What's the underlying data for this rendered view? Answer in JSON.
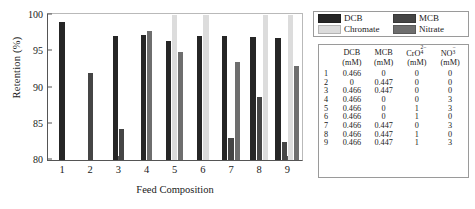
{
  "chart_data": {
    "type": "bar",
    "title": "",
    "xlabel": "Feed Composition",
    "ylabel": "Retention (%)",
    "categories": [
      "1",
      "2",
      "3",
      "4",
      "5",
      "6",
      "7",
      "8",
      "9"
    ],
    "ylim": [
      80,
      100
    ],
    "yticks": [
      80,
      85,
      90,
      95,
      100
    ],
    "grid": false,
    "legend_position": "outside-top-right",
    "series": [
      {
        "name": "DCB",
        "color": "#262626",
        "values": [
          99.0,
          null,
          97.0,
          97.2,
          96.4,
          97.0,
          97.0,
          96.9,
          96.8
        ]
      },
      {
        "name": "MCB",
        "color": "#454545",
        "values": [
          null,
          92.0,
          84.2,
          null,
          null,
          null,
          83.0,
          88.6,
          82.5
        ]
      },
      {
        "name": "Chromate",
        "color": "#dcdcdc",
        "values": [
          null,
          null,
          null,
          null,
          100.0,
          100.0,
          null,
          100.0,
          100.0
        ]
      },
      {
        "name": "Nitrate",
        "color": "#6e6e6e",
        "values": [
          null,
          null,
          null,
          97.7,
          94.8,
          null,
          93.5,
          null,
          93.0
        ]
      }
    ]
  },
  "legend": {
    "items": [
      {
        "label": "DCB",
        "color": "#262626"
      },
      {
        "label": "MCB",
        "color": "#454545"
      },
      {
        "label": "Chromate",
        "color": "#dcdcdc"
      },
      {
        "label": "Nitrate",
        "color": "#6e6e6e"
      }
    ]
  },
  "table": {
    "headers_line1": [
      "",
      "DCB",
      "MCB",
      "CrO4",
      "NO3"
    ],
    "headers_line2": [
      "",
      "(mM)",
      "(mM)",
      "(mM)",
      "(mM)"
    ],
    "col3_sup": "2−",
    "col3_sub": "4",
    "col4_sup": "−",
    "col4_sub": "3",
    "rows": [
      {
        "idx": "1",
        "dcb": "0.466",
        "mcb": "0",
        "cro4": "0",
        "no3": "0"
      },
      {
        "idx": "2",
        "dcb": "0",
        "mcb": "0.447",
        "cro4": "0",
        "no3": "0"
      },
      {
        "idx": "3",
        "dcb": "0.466",
        "mcb": "0.447",
        "cro4": "0",
        "no3": "0"
      },
      {
        "idx": "4",
        "dcb": "0.466",
        "mcb": "0",
        "cro4": "0",
        "no3": "3"
      },
      {
        "idx": "5",
        "dcb": "0.466",
        "mcb": "0",
        "cro4": "1",
        "no3": "3"
      },
      {
        "idx": "6",
        "dcb": "0.466",
        "mcb": "0",
        "cro4": "1",
        "no3": "0"
      },
      {
        "idx": "7",
        "dcb": "0.466",
        "mcb": "0.447",
        "cro4": "0",
        "no3": "3"
      },
      {
        "idx": "8",
        "dcb": "0.466",
        "mcb": "0.447",
        "cro4": "1",
        "no3": "0"
      },
      {
        "idx": "9",
        "dcb": "0.466",
        "mcb": "0.447",
        "cro4": "1",
        "no3": "3"
      }
    ]
  }
}
